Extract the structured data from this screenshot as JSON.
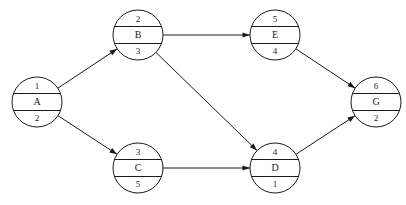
{
  "diagram": {
    "type": "activity-on-node-network",
    "title": "",
    "canvas": {
      "width": 406,
      "height": 205,
      "background": "#ffffff"
    },
    "style": {
      "stroke_color": "#1a1a1a",
      "node_fill": "#ffffff",
      "node_radius": 25,
      "stroke_width": 1
    },
    "nodes": [
      {
        "id": "A",
        "label": "A",
        "top": "1",
        "bottom": "2",
        "cx": 37,
        "cy": 102
      },
      {
        "id": "B",
        "label": "B",
        "top": "2",
        "bottom": "3",
        "cx": 138,
        "cy": 35
      },
      {
        "id": "C",
        "label": "C",
        "top": "3",
        "bottom": "5",
        "cx": 138,
        "cy": 168
      },
      {
        "id": "E",
        "label": "E",
        "top": "5",
        "bottom": "4",
        "cx": 275,
        "cy": 35
      },
      {
        "id": "D",
        "label": "D",
        "top": "4",
        "bottom": "1",
        "cx": 275,
        "cy": 168
      },
      {
        "id": "G",
        "label": "G",
        "top": "6",
        "bottom": "2",
        "cx": 376,
        "cy": 102
      }
    ],
    "edges": [
      {
        "from": "A",
        "to": "B",
        "directed": true
      },
      {
        "from": "A",
        "to": "C",
        "directed": true
      },
      {
        "from": "B",
        "to": "E",
        "directed": true
      },
      {
        "from": "B",
        "to": "D",
        "directed": true
      },
      {
        "from": "C",
        "to": "D",
        "directed": true
      },
      {
        "from": "E",
        "to": "G",
        "directed": true
      },
      {
        "from": "D",
        "to": "G",
        "directed": true
      }
    ]
  }
}
